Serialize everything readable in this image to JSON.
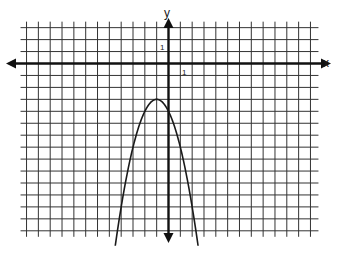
{
  "chart_data": {
    "type": "line",
    "title": "",
    "xlabel": "x",
    "ylabel": "y",
    "tick_labels": {
      "x_unit": "1",
      "y_unit": "1"
    },
    "xlim": [
      -12,
      12
    ],
    "ylim": [
      -14,
      3
    ],
    "grid": true,
    "series": [
      {
        "name": "y = -(x+1)^2 - 3",
        "function": "-(x+1)^2 - 3",
        "vertex": [
          -1,
          -3
        ],
        "y_intercept": -4,
        "x_range": [
          -4.5,
          2.5
        ],
        "x": [
          -4.5,
          -4,
          -3,
          -2,
          -1,
          0,
          1,
          2,
          2.5
        ],
        "values": [
          -15.25,
          -12,
          -7,
          -4,
          -3,
          -4,
          -7,
          -12,
          -15.25
        ]
      }
    ]
  },
  "colors": {
    "grid": "#333333",
    "axis": "#111111",
    "curve": "#1a1a1a",
    "background": "#ffffff"
  },
  "layout": {
    "origin_px": [
      168.5,
      63.5
    ],
    "unit_px_x": 11.83,
    "unit_px_y": 11.95
  }
}
